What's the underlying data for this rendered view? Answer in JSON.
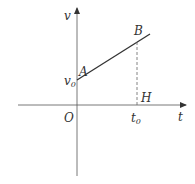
{
  "diagram": {
    "type": "velocity-time graph",
    "axes": {
      "vertical_label": "v",
      "horizontal_label": "t",
      "origin_label": "O"
    },
    "points": {
      "A": "A",
      "B": "B",
      "H": "H"
    },
    "intercept_label": {
      "base": "v",
      "sub": "0"
    },
    "time_label": {
      "base": "t",
      "sub": "0"
    },
    "colors": {
      "line": "#333333",
      "axis": "#555555",
      "dashed": "#666666"
    }
  }
}
